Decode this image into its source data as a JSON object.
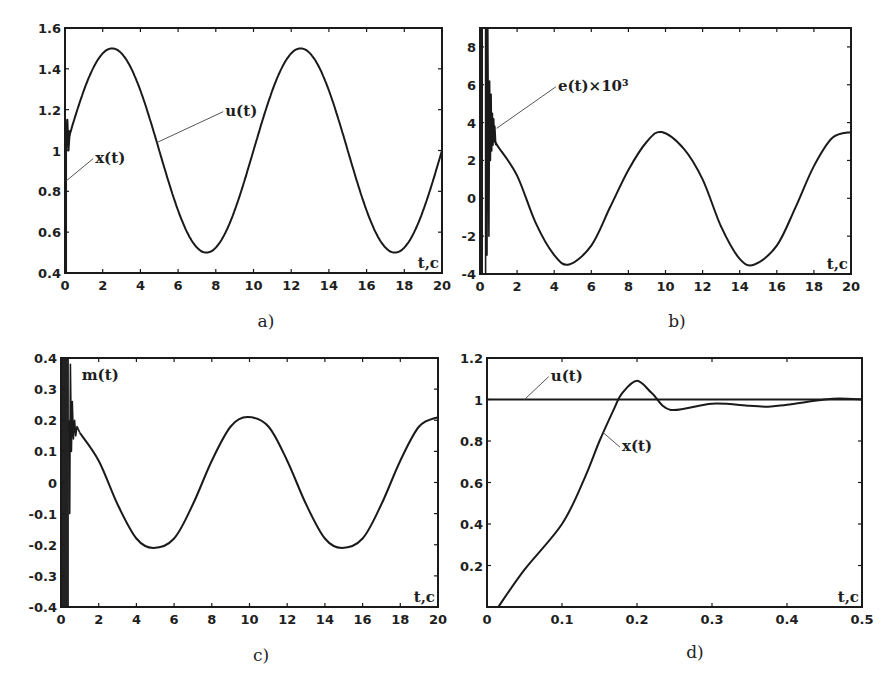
{
  "figure": {
    "captions": [
      "a)",
      "b)",
      "c)",
      "d)"
    ]
  },
  "chart_data": [
    {
      "id": "a",
      "type": "line",
      "caption": "a)",
      "title": "",
      "xlabel": "t,c",
      "ylabel": "",
      "xlim": [
        0,
        20
      ],
      "ylim": [
        0.4,
        1.6
      ],
      "xticks": [
        0,
        2,
        4,
        6,
        8,
        10,
        12,
        14,
        16,
        18,
        20
      ],
      "yticks": [
        0.4,
        0.6,
        0.8,
        1,
        1.2,
        1.4,
        1.6
      ],
      "xticklabels": [
        "0",
        "2",
        "4",
        "6",
        "8",
        "10",
        "12",
        "14",
        "16",
        "18",
        "20"
      ],
      "yticklabels": [
        "0.4",
        "0.6",
        "0.8",
        "1",
        "1.2",
        "1.4",
        "1.6"
      ],
      "grid": false,
      "series": [
        {
          "name": "u(t)",
          "formula": "1 + 0.5*sin(2*pi*t/10)",
          "description": "sinusoid, amplitude 0.5 around 1, period 10 s; peaks 1.5 at t=2.5,12.5; troughs 0.5 at t=7.5,17.5"
        },
        {
          "name": "x(t)",
          "description": "tracks u(t) after a brief transient near t=0 (spikes from ~0.4 up to ~1.15)"
        }
      ],
      "x": [
        0,
        1,
        2,
        2.5,
        3,
        4,
        5,
        6,
        7,
        7.5,
        8,
        9,
        10,
        11,
        12,
        12.5,
        13,
        14,
        15,
        16,
        17,
        17.5,
        18,
        19,
        20
      ],
      "values_u": [
        1.0,
        1.29,
        1.48,
        1.5,
        1.48,
        1.29,
        1.0,
        0.71,
        0.52,
        0.5,
        0.52,
        0.71,
        1.0,
        1.29,
        1.48,
        1.5,
        1.48,
        1.29,
        1.0,
        0.71,
        0.52,
        0.5,
        0.52,
        0.71,
        1.0
      ],
      "annotations": [
        {
          "text": "u(t)",
          "x": 8.5,
          "y": 1.2,
          "arrow_to": [
            4.9,
            1.04
          ]
        },
        {
          "text": "x(t)",
          "x": 1.6,
          "y": 0.97,
          "arrow_to": [
            0.05,
            0.85
          ]
        }
      ],
      "legend": "none"
    },
    {
      "id": "b",
      "type": "line",
      "caption": "b)",
      "title": "",
      "xlabel": "t,c",
      "ylabel": "",
      "xlim": [
        0,
        20
      ],
      "ylim": [
        -4,
        9
      ],
      "xticks": [
        0,
        2,
        4,
        6,
        8,
        10,
        12,
        14,
        16,
        18,
        20
      ],
      "yticks": [
        -4,
        -2,
        0,
        2,
        4,
        6,
        8
      ],
      "xticklabels": [
        "0",
        "2",
        "4",
        "6",
        "8",
        "10",
        "12",
        "14",
        "16",
        "18",
        "20"
      ],
      "yticklabels": [
        "-4",
        "-2",
        "0",
        "2",
        "4",
        "6",
        "8"
      ],
      "grid": false,
      "series": [
        {
          "name": "e(t)×10³",
          "description": "large oscillation in t<0.8 s spanning full axis (-4..9), then roughly sinusoidal with small staircase ripple; amplitude ~3.5, period 10 s; max ~3.5 at t≈9.8, min ~-3.5 at t≈4.8 and 14.8"
        }
      ],
      "x": [
        0.8,
        1,
        2,
        3,
        4,
        4.8,
        6,
        7,
        8,
        9,
        9.8,
        11,
        12,
        13,
        14,
        14.8,
        16,
        17,
        18,
        19,
        20
      ],
      "values": [
        3.0,
        2.7,
        1.2,
        -1.3,
        -3.0,
        -3.5,
        -2.5,
        -0.5,
        1.5,
        3.0,
        3.5,
        2.6,
        1.0,
        -1.5,
        -3.2,
        -3.5,
        -2.5,
        -0.5,
        1.7,
        3.2,
        3.5
      ],
      "annotations": [
        {
          "text": "e(t)×10³",
          "x": 4.2,
          "y": 6.0,
          "arrow_to": [
            0.9,
            3.7
          ]
        }
      ],
      "legend": "none"
    },
    {
      "id": "c",
      "type": "line",
      "caption": "c)",
      "title": "",
      "xlabel": "t,c",
      "ylabel": "",
      "xlim": [
        0,
        20
      ],
      "ylim": [
        -0.4,
        0.4
      ],
      "xticks": [
        0,
        2,
        4,
        6,
        8,
        10,
        12,
        14,
        16,
        18,
        20
      ],
      "yticks": [
        -0.4,
        -0.3,
        -0.2,
        -0.1,
        0,
        0.1,
        0.2,
        0.3,
        0.4
      ],
      "xticklabels": [
        "0",
        "2",
        "4",
        "6",
        "8",
        "10",
        "12",
        "14",
        "16",
        "18",
        "20"
      ],
      "yticklabels": [
        "-0.4",
        "-0.3",
        "-0.2",
        "-0.1",
        "0",
        "0.1",
        "0.2",
        "0.3",
        "0.4"
      ],
      "grid": false,
      "series": [
        {
          "name": "m(t)",
          "description": "dense chattering over full range (-0.4..0.4) for t<0.5 s, then sinusoid amplitude ~0.21, period 10 s; max ~0.21 at t≈9.9 and 20, min ~-0.21 at t≈4.9 and 14.9"
        }
      ],
      "x": [
        1,
        2,
        3,
        4,
        4.9,
        6,
        7,
        8,
        9,
        9.9,
        11,
        12,
        13,
        14,
        14.9,
        16,
        17,
        18,
        19,
        20
      ],
      "values": [
        0.16,
        0.07,
        -0.07,
        -0.18,
        -0.21,
        -0.18,
        -0.07,
        0.07,
        0.18,
        0.21,
        0.18,
        0.07,
        -0.07,
        -0.18,
        -0.21,
        -0.18,
        -0.07,
        0.07,
        0.18,
        0.21
      ],
      "annotations": [
        {
          "text": "m(t)",
          "x": 1.1,
          "y": 0.35
        }
      ],
      "legend": "none"
    },
    {
      "id": "d",
      "type": "line",
      "caption": "d)",
      "title": "",
      "xlabel": "t,c",
      "ylabel": "",
      "xlim": [
        0,
        0.5
      ],
      "ylim": [
        0,
        1.2
      ],
      "xticks": [
        0,
        0.1,
        0.2,
        0.3,
        0.4,
        0.5
      ],
      "yticks": [
        0.2,
        0.4,
        0.6,
        0.8,
        1,
        1.2
      ],
      "xticklabels": [
        "0",
        "0.1",
        "0.2",
        "0.3",
        "0.4",
        "0.5"
      ],
      "yticklabels": [
        "0.2",
        "0.4",
        "0.6",
        "0.8",
        "1",
        "1.2"
      ],
      "grid": false,
      "series": [
        {
          "name": "u(t)",
          "description": "constant step at 1"
        },
        {
          "name": "x(t)",
          "description": "step response: ~linear rise from 0 at t≈0.015, overshoot to ~1.09 at t≈0.2, undershoot ~0.95 at t≈0.245, settles to 1"
        }
      ],
      "x": [
        0,
        0.5
      ],
      "values_u": [
        1,
        1
      ],
      "x_response": [
        0.015,
        0.05,
        0.1,
        0.13,
        0.15,
        0.17,
        0.18,
        0.2,
        0.22,
        0.245,
        0.3,
        0.35,
        0.375,
        0.4,
        0.45,
        0.47,
        0.5
      ],
      "values_x": [
        0.0,
        0.18,
        0.4,
        0.62,
        0.8,
        0.96,
        1.03,
        1.09,
        1.03,
        0.95,
        0.98,
        0.97,
        0.965,
        0.975,
        1.0,
        1.005,
        1.0
      ],
      "annotations": [
        {
          "text": "u(t)",
          "x": 0.085,
          "y": 1.12,
          "arrow_to": [
            0.05,
            1.0
          ]
        },
        {
          "text": "x(t)",
          "x": 0.18,
          "y": 0.78,
          "arrow_to": [
            0.155,
            0.84
          ]
        }
      ],
      "legend": "none"
    }
  ]
}
